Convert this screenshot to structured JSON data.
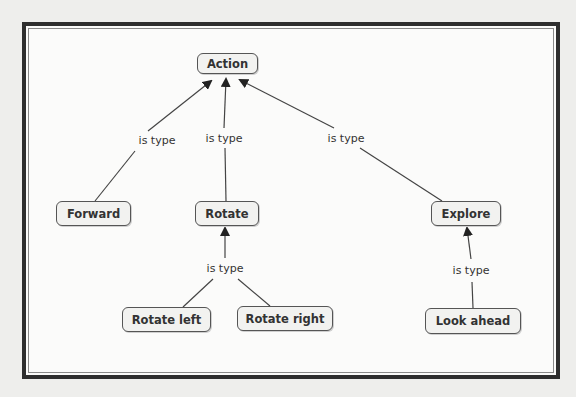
{
  "diagram": {
    "type": "concept-map",
    "colors": {
      "frame": "#2e2e2e",
      "node_border": "#555555",
      "node_fill": "#f2f2f0",
      "edge": "#444444",
      "text": "#333333"
    },
    "nodes": {
      "action": {
        "label": "Action"
      },
      "forward": {
        "label": "Forward"
      },
      "rotate": {
        "label": "Rotate"
      },
      "explore": {
        "label": "Explore"
      },
      "rotate_left": {
        "label": "Rotate left"
      },
      "rotate_right": {
        "label": "Rotate right"
      },
      "look_ahead": {
        "label": "Look ahead"
      }
    },
    "edges": [
      {
        "from": "Forward",
        "to": "Action",
        "label": "is type"
      },
      {
        "from": "Rotate",
        "to": "Action",
        "label": "is type"
      },
      {
        "from": "Explore",
        "to": "Action",
        "label": "is type"
      },
      {
        "from": "Rotate left, Rotate right",
        "to": "Rotate",
        "label": "is type"
      },
      {
        "from": "Look ahead",
        "to": "Explore",
        "label": "is type"
      }
    ]
  }
}
